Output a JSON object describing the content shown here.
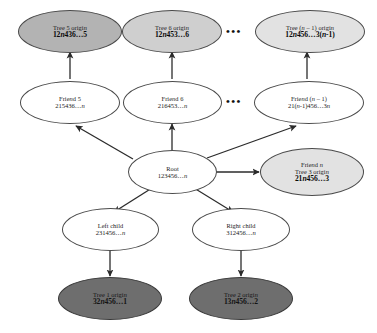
{
  "diagram": {
    "nodes": [
      {
        "id": "tree5-origin",
        "name": "tree-5-origin-node",
        "label": "Tree 5 origin",
        "code": "12n436…5",
        "fill": "#b3b3b3",
        "shade": "medium"
      },
      {
        "id": "tree6-origin",
        "name": "tree-6-origin-node",
        "label": "Tree 6 origin",
        "code": "12n453…6",
        "fill": "#cfcfcf",
        "shade": "light"
      },
      {
        "id": "treen1-origin",
        "name": "tree-n-minus-1-origin-node",
        "label": "Tree (n – 1) origin",
        "code": "12n456…3(n-1)",
        "fill": "#e2e2e2",
        "shade": "pale"
      },
      {
        "id": "friend5",
        "name": "friend-5-node",
        "label": "Friend 5",
        "code": "215436…n",
        "fill": "#ffffff",
        "shade": "white"
      },
      {
        "id": "friend6",
        "name": "friend-6-node",
        "label": "Friend 6",
        "code": "216453…n",
        "fill": "#ffffff",
        "shade": "white"
      },
      {
        "id": "friendn1",
        "name": "friend-n-minus-1-node",
        "label": "Friend (n – 1)",
        "code": "21(n-1)456…3n",
        "fill": "#ffffff",
        "shade": "white"
      },
      {
        "id": "root",
        "name": "root-node",
        "label": "Root",
        "code": "123456…n",
        "fill": "#ffffff",
        "shade": "white"
      },
      {
        "id": "friendn",
        "name": "friend-n-tree-3-origin-node",
        "label": "Friend n",
        "sublabel": "Tree 3 origin",
        "code": "21n456…3",
        "fill": "#e2e2e2",
        "shade": "pale"
      },
      {
        "id": "leftchild",
        "name": "left-child-node",
        "label": "Left child",
        "code": "231456…n",
        "fill": "#ffffff",
        "shade": "white"
      },
      {
        "id": "rightchild",
        "name": "right-child-node",
        "label": "Right child",
        "code": "312456…n",
        "fill": "#ffffff",
        "shade": "white"
      },
      {
        "id": "tree1-origin",
        "name": "tree-1-origin-node",
        "label": "Tree 1 origin",
        "code": "32n456…1",
        "fill": "#6e6e6e",
        "shade": "dark"
      },
      {
        "id": "tree2-origin",
        "name": "tree-2-origin-node",
        "label": "Tree 2 origin",
        "code": "13n456…2",
        "fill": "#6e6e6e",
        "shade": "dark"
      }
    ],
    "ellipses": [
      {
        "name": "ellipsis-tree-row",
        "text": "•••"
      },
      {
        "name": "ellipsis-friend-row",
        "text": "•••"
      }
    ],
    "edges": [
      {
        "name": "edge-friend5-to-tree5",
        "from": "friend5",
        "to": "tree5-origin"
      },
      {
        "name": "edge-friend6-to-tree6",
        "from": "friend6",
        "to": "tree6-origin"
      },
      {
        "name": "edge-friendn1-to-treen1",
        "from": "friendn1",
        "to": "treen1-origin"
      },
      {
        "name": "edge-root-to-friend5",
        "from": "root",
        "to": "friend5"
      },
      {
        "name": "edge-root-to-friend6",
        "from": "root",
        "to": "friend6"
      },
      {
        "name": "edge-root-to-friendn1",
        "from": "root",
        "to": "friendn1"
      },
      {
        "name": "edge-root-to-friendn",
        "from": "root",
        "to": "friendn"
      },
      {
        "name": "edge-root-to-leftchild",
        "from": "root",
        "to": "leftchild"
      },
      {
        "name": "edge-root-to-rightchild",
        "from": "root",
        "to": "rightchild"
      },
      {
        "name": "edge-leftchild-to-tree1",
        "from": "leftchild",
        "to": "tree1-origin"
      },
      {
        "name": "edge-rightchild-to-tree2",
        "from": "rightchild",
        "to": "tree2-origin"
      }
    ]
  }
}
